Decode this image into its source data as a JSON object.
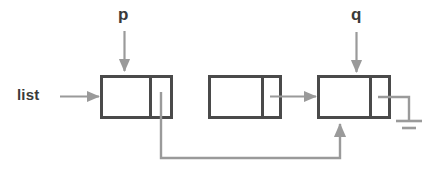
{
  "diagram": {
    "background_color": "#ffffff",
    "node_border_color": "#4a4a4a",
    "pointer_color": "#9a9a9a",
    "label_color": "#3a3a3a",
    "labels": {
      "head": "list",
      "pointer_p": "p",
      "pointer_q": "q"
    },
    "nodes": [
      {
        "id": "node-1",
        "data_field": "",
        "next_field": "",
        "x": 101,
        "y": 76,
        "width": 71,
        "height": 42,
        "divider_x": 150
      },
      {
        "id": "node-2",
        "data_field": "",
        "next_field": "",
        "x": 209,
        "y": 76,
        "width": 72,
        "height": 42,
        "divider_x": 262
      },
      {
        "id": "node-3",
        "data_field": "",
        "next_field": "",
        "x": 318,
        "y": 76,
        "width": 72,
        "height": 42,
        "divider_x": 370
      }
    ],
    "edges": [
      {
        "id": "edge-list-to-node1",
        "from": "list",
        "to": "node-1",
        "kind": "horizontal-arrow"
      },
      {
        "id": "edge-p-to-node1",
        "from": "p",
        "to": "node-1",
        "kind": "vertical-arrow"
      },
      {
        "id": "edge-q-to-node3",
        "from": "q",
        "to": "node-3",
        "kind": "vertical-arrow"
      },
      {
        "id": "edge-node1-to-node3",
        "from": "node-1",
        "to": "node-3",
        "kind": "routed-arrow"
      },
      {
        "id": "edge-node2-to-node3",
        "from": "node-2",
        "to": "node-3",
        "kind": "horizontal-arrow"
      },
      {
        "id": "edge-node3-to-null",
        "from": "node-3",
        "to": "null",
        "kind": "ground-terminator"
      }
    ]
  }
}
